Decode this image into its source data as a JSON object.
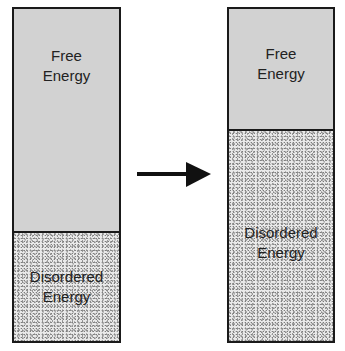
{
  "diagram": {
    "left_bar": {
      "free_label_1": "Free",
      "free_label_2": "Energy",
      "disordered_label_1": "Disordered",
      "disordered_label_2": "Energy",
      "free_fraction": 0.67
    },
    "right_bar": {
      "free_label_1": "Free",
      "free_label_2": "Energy",
      "disordered_label_1": "Disordered",
      "disordered_label_2": "Energy",
      "free_fraction": 0.36
    },
    "arrow": "right-arrow",
    "colors": {
      "free": "#d2d2d2",
      "disordered": "#e9e9e9",
      "border": "#1a1a1a"
    }
  }
}
